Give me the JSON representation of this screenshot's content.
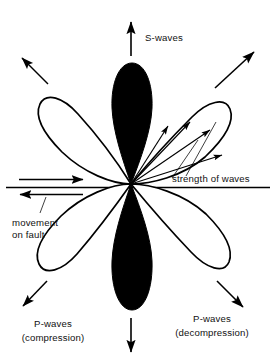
{
  "figure": {
    "type": "radiation-pattern-diagram",
    "background_color": "#ffffff",
    "ink_color": "#000000",
    "center": {
      "x": 131,
      "y": 184
    }
  },
  "labels": {
    "s_waves": "S-waves",
    "p_waves_compression_line1": "P-waves",
    "p_waves_compression_line2": "(compression)",
    "p_waves_decompression_line1": "P-waves",
    "p_waves_decompression_line2": "(decompression)",
    "movement_on_fault_line1": "movement",
    "movement_on_fault_line2": "on fault",
    "strength_of_waves": "strength of waves"
  },
  "lobes": [
    {
      "name": "top-lobe",
      "polarity": "compression",
      "fill": "#000000",
      "direction_deg": 90,
      "description": "solid black vertical lobe pointing up"
    },
    {
      "name": "bottom-lobe",
      "polarity": "compression",
      "fill": "#000000",
      "direction_deg": 270,
      "description": "solid black vertical lobe pointing down"
    },
    {
      "name": "upper-left-lobe",
      "polarity": "decompression",
      "fill": "#ffffff",
      "direction_deg": 135,
      "description": "white outlined lobe pointing upper-left"
    },
    {
      "name": "upper-right-lobe",
      "polarity": "decompression",
      "fill": "#ffffff",
      "direction_deg": 45,
      "description": "white outlined lobe pointing upper-right, contains strength vectors"
    },
    {
      "name": "lower-left-lobe",
      "polarity": "decompression",
      "fill": "#ffffff",
      "direction_deg": 225,
      "description": "white outlined lobe pointing lower-left"
    },
    {
      "name": "lower-right-lobe",
      "polarity": "decompression",
      "fill": "#ffffff",
      "direction_deg": 315,
      "description": "white outlined lobe pointing lower-right"
    }
  ],
  "arrows": {
    "s_wave_up": {
      "direction": "up",
      "label": "S-waves"
    },
    "s_wave_down": {
      "direction": "down",
      "label": ""
    },
    "p_wave_upper_left": {
      "direction": "up-left",
      "label": ""
    },
    "p_wave_upper_right": {
      "direction": "up-right",
      "label": ""
    },
    "p_wave_lower_left": {
      "direction": "down-left",
      "label": "P-waves (compression)"
    },
    "p_wave_lower_right": {
      "direction": "down-right",
      "label": "P-waves (decompression)"
    },
    "fault_slip_top": {
      "direction": "right",
      "label": "movement on fault"
    },
    "fault_slip_bottom": {
      "direction": "left",
      "label": "movement on fault"
    }
  },
  "strength_vectors": {
    "count": 4,
    "description": "radial arrows from focus to lobe boundary showing amplitude with azimuth",
    "angles_deg": [
      18,
      33,
      48,
      62
    ]
  }
}
